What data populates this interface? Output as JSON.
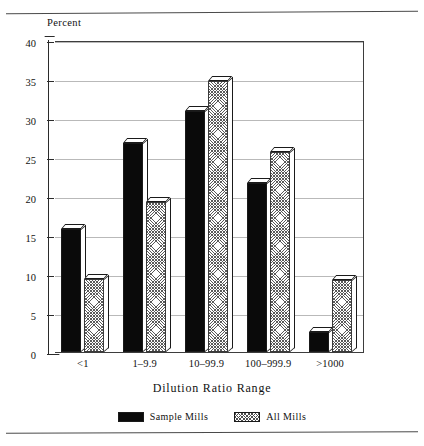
{
  "chart_data": {
    "type": "bar",
    "title": "",
    "subtitle": "",
    "xlabel": "Dilution Ratio Range",
    "ylabel": "Percent",
    "categories": [
      "<1",
      "1–9.9",
      "10–99.9",
      "100–999.9",
      ">1000"
    ],
    "series": [
      {
        "name": "Sample Mills",
        "values": [
          15.8,
          26.8,
          30.9,
          21.7,
          2.6
        ],
        "color": "#0a0a0a",
        "fill": "solid"
      },
      {
        "name": "All Mills",
        "values": [
          9.4,
          19.2,
          34.7,
          25.6,
          9.2
        ],
        "color": "#5a5a5a",
        "fill": "crosshatch"
      }
    ],
    "ylim": [
      0,
      40
    ],
    "yticks": [
      0,
      5,
      10,
      15,
      20,
      25,
      30,
      35,
      40
    ],
    "ytick_labels": [
      "0",
      "5",
      "10",
      "15",
      "20",
      "25",
      "30",
      "35",
      "40"
    ],
    "grid": true,
    "grid_axis": "y",
    "legend_position": "bottom",
    "style": "3d-bars"
  },
  "legend": {
    "items": [
      {
        "label": "Sample Mills",
        "swatch": "solid-black"
      },
      {
        "label": "All Mills",
        "swatch": "crosshatch"
      }
    ]
  },
  "colors": {
    "bar_solid": "#0a0a0a",
    "bar_hatch_line": "#5a5a5a",
    "grid": "#b9b9b9",
    "axis": "#2b2b2b",
    "background": "#ffffff",
    "rule": "#4a4a4a"
  }
}
